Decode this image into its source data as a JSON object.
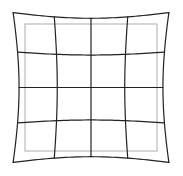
{
  "diagram": {
    "name": "pincushion-distortion-grid",
    "type": "distorted-grid",
    "distortion": "pincushion",
    "grid_rows": 4,
    "grid_cols": 4,
    "line_count": 5,
    "distortion_coefficient": 0.09,
    "samples_per_line": 40,
    "canvas": {
      "width": 183,
      "height": 176
    },
    "center": {
      "x": 91,
      "y": 87.5
    },
    "half_width": 66,
    "half_height": 63.5,
    "colors": {
      "background": "#ffffff",
      "distorted_grid": "#222222",
      "reference_square": "#b4b4b4"
    },
    "stroke": {
      "grid_width": 1.2,
      "reference_width": 1.1
    }
  }
}
